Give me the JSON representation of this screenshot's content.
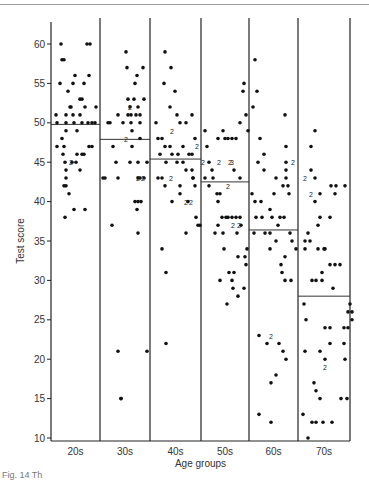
{
  "chart_data": {
    "type": "scatter",
    "title": "",
    "xlabel": "Age groups",
    "ylabel": "Test score",
    "ylim": [
      10,
      61
    ],
    "yticks": [
      10,
      15,
      20,
      25,
      30,
      35,
      40,
      45,
      50,
      55,
      60
    ],
    "grid": false,
    "legend": null,
    "categories": [
      "20s",
      "30s",
      "40s",
      "50s",
      "60s",
      "70s"
    ],
    "group_means": [
      49.8,
      47.9,
      45.4,
      42.5,
      36.4,
      28.0
    ],
    "annotation_note": "Numerals '2' and '3' mark coincident points",
    "series": [
      {
        "name": "20s",
        "points": [
          [
            56,
            51
          ],
          [
            57,
            50
          ],
          [
            57,
            47
          ],
          [
            61,
            60
          ],
          [
            62,
            58
          ],
          [
            60,
            55
          ],
          [
            64,
            58
          ],
          [
            68,
            54
          ],
          [
            70,
            52
          ],
          [
            66,
            51
          ],
          [
            66,
            50
          ],
          [
            66,
            49
          ],
          [
            62,
            48
          ],
          [
            64,
            47
          ],
          [
            63,
            46
          ],
          [
            65,
            45
          ],
          [
            66,
            44
          ],
          [
            66,
            43
          ],
          [
            64,
            42
          ],
          [
            66,
            42
          ],
          [
            73,
            55
          ],
          [
            75,
            56
          ],
          [
            71,
            52
          ],
          [
            73,
            51
          ],
          [
            74,
            50
          ],
          [
            77,
            49
          ],
          [
            80,
            53
          ],
          [
            80,
            51
          ],
          [
            84,
            55
          ],
          [
            82,
            53
          ],
          [
            82,
            50
          ],
          [
            85,
            52
          ],
          [
            87,
            60
          ],
          [
            90,
            60
          ],
          [
            89,
            56
          ],
          [
            88,
            50
          ],
          [
            92,
            50
          ],
          [
            95,
            50
          ],
          [
            96,
            52
          ],
          [
            69,
            41
          ],
          [
            65,
            38
          ],
          [
            85,
            39
          ],
          [
            74,
            39
          ],
          [
            77,
            46
          ],
          [
            82,
            46
          ],
          [
            84,
            46
          ],
          [
            72,
            45
          ],
          [
            76,
            45
          ],
          [
            80,
            44
          ],
          [
            89,
            47
          ],
          [
            92,
            47
          ]
        ]
      },
      {
        "name": "30s",
        "points": [
          [
            108,
            50
          ],
          [
            110,
            50
          ],
          [
            113,
            47
          ],
          [
            116,
            45
          ],
          [
            118,
            43
          ],
          [
            105,
            43
          ],
          [
            103,
            43
          ],
          [
            112,
            37
          ],
          [
            118,
            21
          ],
          [
            121,
            15
          ],
          [
            126,
            59
          ],
          [
            127,
            57
          ],
          [
            128,
            53
          ],
          [
            130,
            52
          ],
          [
            131,
            51
          ],
          [
            131,
            50
          ],
          [
            132,
            49
          ],
          [
            134,
            53
          ],
          [
            135,
            55
          ],
          [
            137,
            56
          ],
          [
            138,
            52
          ],
          [
            140,
            50
          ],
          [
            140,
            48
          ],
          [
            143,
            57
          ],
          [
            144,
            53
          ],
          [
            130,
            45
          ],
          [
            132,
            47
          ],
          [
            138,
            45
          ],
          [
            138,
            43
          ],
          [
            140,
            43
          ],
          [
            144,
            43
          ],
          [
            135,
            40
          ],
          [
            138,
            40
          ],
          [
            141,
            40
          ],
          [
            137,
            39
          ],
          [
            138,
            36
          ],
          [
            147,
            45
          ],
          [
            147,
            21
          ],
          [
            121,
            15
          ],
          [
            118,
            51
          ],
          [
            123,
            50
          ],
          [
            128,
            51
          ],
          [
            136,
            51
          ],
          [
            140,
            51
          ]
        ]
      },
      {
        "name": "40s",
        "points": [
          [
            165,
            59
          ],
          [
            171,
            57
          ],
          [
            164,
            55
          ],
          [
            175,
            54
          ],
          [
            170,
            52
          ],
          [
            177,
            51
          ],
          [
            180,
            50
          ],
          [
            186,
            50
          ],
          [
            192,
            51
          ],
          [
            195,
            48
          ],
          [
            156,
            50
          ],
          [
            158,
            48
          ],
          [
            162,
            48
          ],
          [
            165,
            47
          ],
          [
            170,
            47
          ],
          [
            172,
            46
          ],
          [
            178,
            46
          ],
          [
            183,
            47
          ],
          [
            189,
            46
          ],
          [
            192,
            46
          ],
          [
            160,
            46
          ],
          [
            166,
            45
          ],
          [
            177,
            45
          ],
          [
            183,
            45
          ],
          [
            186,
            44
          ],
          [
            192,
            44
          ],
          [
            193,
            43
          ],
          [
            158,
            43
          ],
          [
            162,
            43
          ],
          [
            165,
            42
          ],
          [
            172,
            40
          ],
          [
            180,
            41
          ],
          [
            188,
            40
          ],
          [
            195,
            42
          ],
          [
            198,
            37
          ],
          [
            162,
            34
          ],
          [
            166,
            31
          ],
          [
            166,
            22
          ],
          [
            186,
            36
          ],
          [
            193,
            43
          ],
          [
            196,
            38
          ],
          [
            200,
            37
          ],
          [
            180,
            42
          ]
        ]
      },
      {
        "name": "50s",
        "points": [
          [
            205,
            49
          ],
          [
            207,
            47
          ],
          [
            209,
            45
          ],
          [
            212,
            44
          ],
          [
            218,
            48
          ],
          [
            223,
            49
          ],
          [
            225,
            48
          ],
          [
            228,
            48
          ],
          [
            232,
            48
          ],
          [
            236,
            48
          ],
          [
            240,
            50
          ],
          [
            243,
            54
          ],
          [
            244,
            55
          ],
          [
            246,
            51
          ],
          [
            248,
            49
          ],
          [
            205,
            43
          ],
          [
            209,
            42
          ],
          [
            213,
            43
          ],
          [
            218,
            40
          ],
          [
            220,
            41
          ],
          [
            222,
            38
          ],
          [
            228,
            38
          ],
          [
            232,
            38
          ],
          [
            236,
            38
          ],
          [
            240,
            38
          ],
          [
            215,
            36
          ],
          [
            218,
            37
          ],
          [
            223,
            36
          ],
          [
            226,
            38
          ],
          [
            237,
            36
          ],
          [
            241,
            37
          ],
          [
            238,
            33
          ],
          [
            234,
            31
          ],
          [
            229,
            31
          ],
          [
            224,
            34
          ],
          [
            220,
            30
          ],
          [
            227,
            27
          ],
          [
            232,
            30
          ],
          [
            233,
            29
          ],
          [
            238,
            28
          ],
          [
            244,
            29
          ],
          [
            247,
            34
          ],
          [
            246,
            32
          ],
          [
            245,
            33
          ],
          [
            217,
            41
          ],
          [
            234,
            44
          ],
          [
            240,
            43
          ]
        ]
      },
      {
        "name": "60s",
        "points": [
          [
            255,
            58
          ],
          [
            257,
            54
          ],
          [
            253,
            52
          ],
          [
            260,
            48
          ],
          [
            258,
            45
          ],
          [
            264,
            46
          ],
          [
            264,
            44
          ],
          [
            285,
            51
          ],
          [
            286,
            47
          ],
          [
            276,
            43
          ],
          [
            283,
            42
          ],
          [
            286,
            45
          ],
          [
            286,
            44
          ],
          [
            286,
            43
          ],
          [
            288,
            42
          ],
          [
            252,
            41
          ],
          [
            255,
            40
          ],
          [
            261,
            40
          ],
          [
            270,
            39
          ],
          [
            274,
            41
          ],
          [
            289,
            41
          ],
          [
            256,
            38
          ],
          [
            262,
            38
          ],
          [
            272,
            38
          ],
          [
            280,
            38
          ],
          [
            284,
            38
          ],
          [
            278,
            37
          ],
          [
            254,
            36
          ],
          [
            265,
            36
          ],
          [
            270,
            36
          ],
          [
            270,
            34
          ],
          [
            276,
            35
          ],
          [
            281,
            32
          ],
          [
            285,
            33
          ],
          [
            282,
            31
          ],
          [
            285,
            30
          ],
          [
            291,
            30
          ],
          [
            259,
            23
          ],
          [
            267,
            22
          ],
          [
            279,
            22
          ],
          [
            283,
            21
          ],
          [
            286,
            20
          ],
          [
            271,
            17
          ],
          [
            276,
            18
          ],
          [
            259,
            13
          ],
          [
            271,
            12
          ],
          [
            292,
            35
          ],
          [
            296,
            34
          ],
          [
            290,
            36
          ]
        ]
      },
      {
        "name": "70s",
        "points": [
          [
            315,
            49
          ],
          [
            311,
            47
          ],
          [
            311,
            44
          ],
          [
            315,
            40
          ],
          [
            315,
            43
          ],
          [
            320,
            41
          ],
          [
            320,
            38
          ],
          [
            330,
            38
          ],
          [
            335,
            41
          ],
          [
            336,
            42
          ],
          [
            331,
            42
          ],
          [
            345,
            42
          ],
          [
            324,
            34
          ],
          [
            325,
            34
          ],
          [
            330,
            32
          ],
          [
            335,
            32
          ],
          [
            340,
            32
          ],
          [
            333,
            29
          ],
          [
            305,
            35
          ],
          [
            308,
            36
          ],
          [
            310,
            35
          ],
          [
            318,
            37
          ],
          [
            318,
            34
          ],
          [
            322,
            31
          ],
          [
            305,
            34
          ],
          [
            312,
            30
          ],
          [
            316,
            30
          ],
          [
            322,
            30
          ],
          [
            304,
            27
          ],
          [
            350,
            27
          ],
          [
            348,
            26
          ],
          [
            352,
            26
          ],
          [
            352,
            25
          ],
          [
            306,
            25
          ],
          [
            325,
            24
          ],
          [
            330,
            24
          ],
          [
            344,
            24
          ],
          [
            344,
            22
          ],
          [
            305,
            21
          ],
          [
            320,
            21
          ],
          [
            325,
            20
          ],
          [
            330,
            22
          ],
          [
            314,
            17
          ],
          [
            316,
            16
          ],
          [
            320,
            15
          ],
          [
            303,
            13
          ],
          [
            312,
            12
          ],
          [
            316,
            12
          ],
          [
            323,
            12
          ],
          [
            332,
            12
          ],
          [
            341,
            15
          ],
          [
            347,
            15
          ],
          [
            308,
            10
          ],
          [
            345,
            20
          ],
          [
            348,
            24
          ]
        ]
      }
    ]
  },
  "figure": {
    "caption_fragment": "Fig. 14  Th"
  }
}
